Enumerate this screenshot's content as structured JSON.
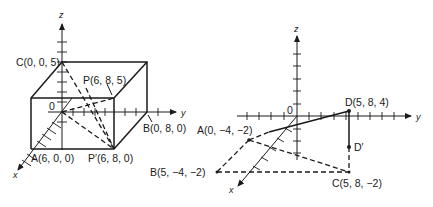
{
  "figure_left": {
    "axes": {
      "x": "x",
      "y": "y",
      "z": "z",
      "origin": "0"
    },
    "points": {
      "C": "C(0, 0, 5)",
      "P": "P(6, 8, 5)",
      "B": "B(0, 8, 0)",
      "A": "A(6, 0, 0)",
      "P_prime": "P′(6, 8, 0)"
    }
  },
  "figure_right": {
    "axes": {
      "x": "x",
      "y": "y",
      "z": "z",
      "origin": "0"
    },
    "points": {
      "D": "D(5, 8, 4)",
      "D_prime": "D′",
      "A": "A(0, −4, −2)",
      "B": "B(5, −4, −2)",
      "C": "C(5, 8, −2)"
    }
  },
  "colors": {
    "ink": "#1a1a1a",
    "background": "#ffffff"
  }
}
